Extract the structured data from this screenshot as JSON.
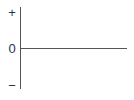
{
  "diagram": {
    "type": "axes",
    "labels": {
      "positive": "+",
      "zero": "0",
      "negative": "−"
    },
    "colors": {
      "axis": "#555555",
      "text": "#333333",
      "background": "#ffffff"
    }
  }
}
